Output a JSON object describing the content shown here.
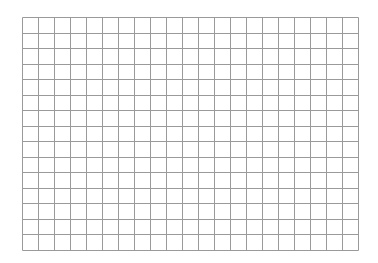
{
  "canvas": {
    "width": 378,
    "height": 263,
    "background": "#ffffff"
  },
  "grid": {
    "left": 22,
    "top": 17,
    "columns": 21,
    "rows": 15,
    "cell_width": 16,
    "cell_height": 15.53,
    "line_color": "#9a9a9a",
    "line_width": 1
  }
}
